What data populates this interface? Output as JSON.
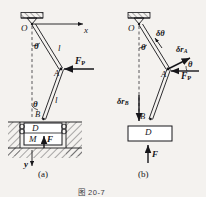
{
  "figure": {
    "caption": "图 20-7",
    "caption_label": "20-7"
  },
  "panels": [
    {
      "key": "a",
      "label": "(a)",
      "description": "slider-crank mechanism with coordinate axes and applied forces",
      "labels": {
        "pivot": "O",
        "axis_x": "x",
        "axis_y": "y",
        "angle": "θ",
        "rod_upper": "l",
        "rod_lower": "l",
        "joint": "A",
        "slider_point": "B",
        "slider_block": "D",
        "moment": "M",
        "force_vertical": "F",
        "force_applied": "F",
        "force_applied_sub": "P"
      }
    },
    {
      "key": "b",
      "label": "(b)",
      "description": "virtual displacement diagram with delta r vectors",
      "labels": {
        "pivot": "O",
        "angle": "θ",
        "virtual_angle": "δθ",
        "joint": "A",
        "virtual_disp_A": "δr",
        "virtual_disp_A_sub": "A",
        "angle_at_A": "θ",
        "slider_point": "B",
        "virtual_disp_B": "δr",
        "virtual_disp_B_sub": "B",
        "slider_block": "D",
        "force_vertical": "F",
        "force_applied": "F",
        "force_applied_sub": "P"
      }
    }
  ],
  "colors": {
    "ink": "#16161a",
    "paper": "#f4f2ef",
    "caption": "#3c3c42"
  }
}
